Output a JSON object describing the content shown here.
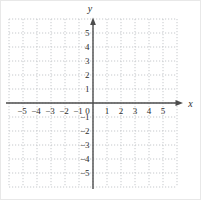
{
  "figure": {
    "origin_label": "0"
  },
  "chart_data": {
    "type": "scatter",
    "title": "",
    "xlabel": "x",
    "ylabel": "y",
    "xlim": [
      -6,
      6
    ],
    "ylim": [
      -6,
      6
    ],
    "grid": true,
    "legend": false,
    "series": [],
    "x_ticks": [
      -5,
      -4,
      -3,
      -2,
      -1,
      0,
      1,
      2,
      3,
      4,
      5
    ],
    "x_tick_labels": [
      "−5",
      "−4",
      "−3",
      "−2",
      "−1",
      "0",
      "1",
      "2",
      "3",
      "4",
      "5"
    ],
    "y_ticks": [
      -5,
      -4,
      -3,
      -2,
      -1,
      1,
      2,
      3,
      4,
      5
    ],
    "y_tick_labels": [
      "−5",
      "−4",
      "−3",
      "−2",
      "−1",
      "1",
      "2",
      "3",
      "4",
      "5"
    ],
    "colors": {
      "grid": "#c6c9cc",
      "axis": "#4c4c4c",
      "text": "#2e2e2e",
      "frame": "#e8e8e8",
      "background": "#ffffff"
    }
  }
}
